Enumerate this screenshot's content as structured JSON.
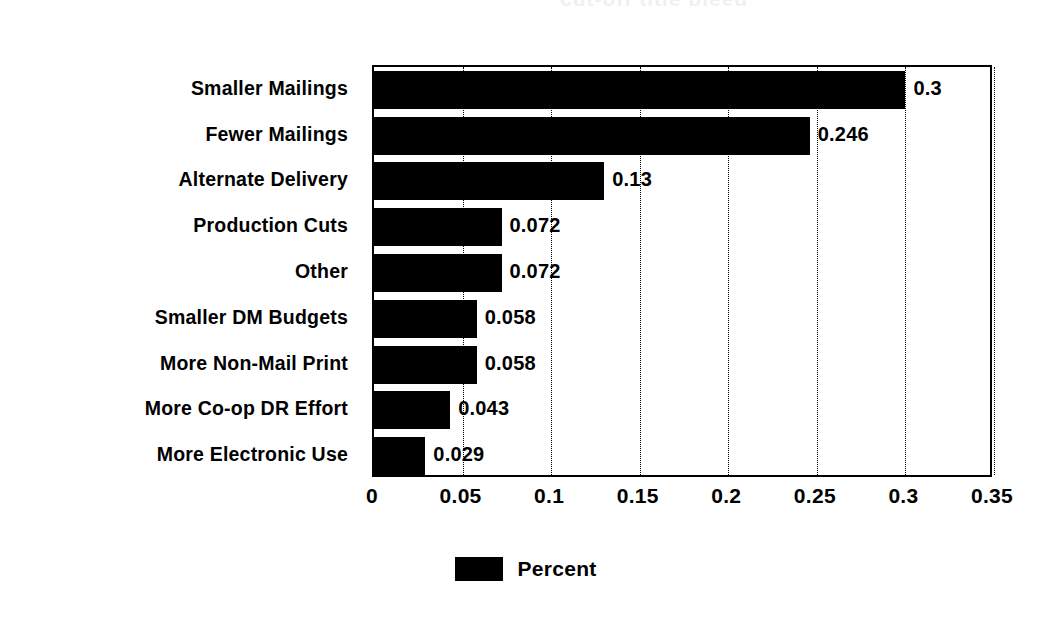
{
  "scan": {
    "bleed_text": "cut-off title bleed"
  },
  "chart_data": {
    "type": "bar",
    "orientation": "horizontal",
    "title": "",
    "xlabel": "",
    "ylabel": "",
    "categories": [
      "Smaller Mailings",
      "Fewer Mailings",
      "Alternate Delivery",
      "Production Cuts",
      "Other",
      "Smaller DM Budgets",
      "More Non-Mail Print",
      "More Co-op DR Effort",
      "More Electronic Use"
    ],
    "values": [
      0.3,
      0.246,
      0.13,
      0.072,
      0.072,
      0.058,
      0.058,
      0.043,
      0.029
    ],
    "value_labels": [
      "0.3",
      "0.246",
      "0.13",
      "0.072",
      "0.072",
      "0.058",
      "0.058",
      "0.043",
      "0.029"
    ],
    "series": [
      {
        "name": "Percent",
        "color": "#000000",
        "values": [
          0.3,
          0.246,
          0.13,
          0.072,
          0.072,
          0.058,
          0.058,
          0.043,
          0.029
        ]
      }
    ],
    "xlim": [
      0,
      0.35
    ],
    "xticks": [
      0,
      0.05,
      0.1,
      0.15,
      0.2,
      0.25,
      0.3,
      0.35
    ],
    "xtick_labels": [
      "0",
      "0.05",
      "0.1",
      "0.15",
      "0.2",
      "0.25",
      "0.3",
      "0.35"
    ],
    "grid": {
      "vertical": true,
      "horizontal": false,
      "style": "dotted"
    },
    "legend": {
      "position": "bottom-center",
      "entries": [
        {
          "label": "Percent",
          "color": "#000000"
        }
      ]
    },
    "background_color": "#ffffff",
    "bar_color": "#000000",
    "axis_color": "#000000"
  }
}
